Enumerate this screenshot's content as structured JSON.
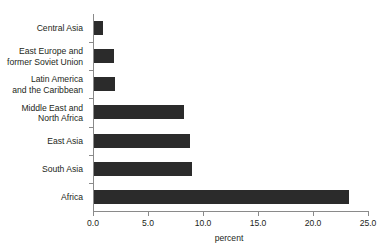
{
  "chart_data": {
    "type": "bar",
    "orientation": "horizontal",
    "title": "",
    "subtitle": "",
    "xlabel": "percent",
    "ylabel": "",
    "categories": [
      "Central Asia",
      "East Europe and\nformer Soviet Union",
      "Latin America\nand the Caribbean",
      "Middle East and\nNorth Africa",
      "East Asia",
      "South Asia",
      "Africa"
    ],
    "values": [
      0.9,
      1.9,
      2.0,
      8.3,
      8.8,
      9.0,
      23.3
    ],
    "xlim": [
      0.0,
      25.0
    ],
    "xticks": [
      0.0,
      5.0,
      10.0,
      15.0,
      20.0,
      25.0
    ],
    "xticklabels": [
      "0.0",
      "5.0",
      "10.0",
      "15.0",
      "20.0",
      "25.0"
    ],
    "grid": false,
    "legend": null,
    "bar_color": "#2b2b2b",
    "axis_color": "#8a8a8a",
    "text_color": "#231f20",
    "background": "#ffffff"
  }
}
